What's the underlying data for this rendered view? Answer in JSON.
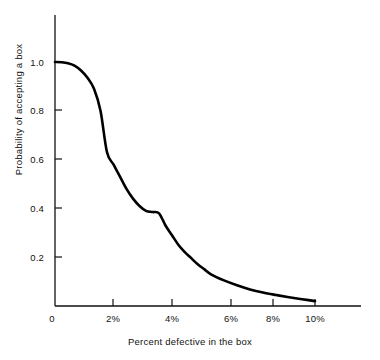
{
  "chart_data": {
    "type": "line",
    "title": "",
    "xlabel": "Percent defective in the box",
    "ylabel": "Probability of accepting a box",
    "xlim": [
      0,
      12.1
    ],
    "ylim": [
      0,
      1.08
    ],
    "grid": false,
    "legend": null,
    "x_tick_labels": [
      "0",
      "2%",
      "4%",
      "6%",
      "8%",
      "10%"
    ],
    "x_tick_values": [
      0,
      2,
      4,
      6,
      8,
      10
    ],
    "y_tick_labels": [
      "0",
      "0.2",
      "0.4",
      "0.6",
      "0.8",
      "1.0"
    ],
    "y_tick_values": [
      0,
      0.2,
      0.4,
      0.6,
      0.8,
      1.0
    ],
    "series": [
      {
        "name": "Operating characteristic curve",
        "color": "#000000",
        "line_width": 2.6,
        "x": [
          0.0,
          0.25,
          0.5,
          0.75,
          1.0,
          1.25,
          1.5,
          1.75,
          2.0,
          2.25,
          2.5,
          2.75,
          3.0,
          3.25,
          3.5,
          3.75,
          4.0,
          4.25,
          4.5,
          4.75,
          5.0,
          5.25,
          5.5,
          5.75,
          6.0,
          6.5,
          7.0,
          7.5,
          8.0,
          8.5,
          9.0,
          9.5,
          10.0
        ],
        "y": [
          1.0,
          0.999,
          0.995,
          0.985,
          0.965,
          0.935,
          0.89,
          0.8,
          0.63,
          0.58,
          0.53,
          0.48,
          0.44,
          0.41,
          0.39,
          0.385,
          0.38,
          0.33,
          0.29,
          0.25,
          0.22,
          0.195,
          0.17,
          0.15,
          0.13,
          0.105,
          0.085,
          0.068,
          0.055,
          0.045,
          0.036,
          0.028,
          0.02
        ]
      }
    ],
    "annotations": []
  },
  "axes": {
    "origin_label": "0",
    "y_axis_line_color": "#111111",
    "x_axis_line_color": "#111111",
    "tick_direction": "inward"
  }
}
